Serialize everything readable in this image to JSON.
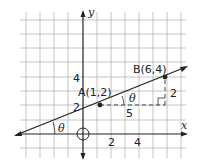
{
  "diagram": {
    "axes": {
      "x_label": "x",
      "y_label": "y"
    },
    "x_ticks": [
      "2",
      "4"
    ],
    "y_ticks": [
      "2",
      "4"
    ],
    "points": [
      {
        "name": "A",
        "label": "A(1,2)",
        "x": 1,
        "y": 2
      },
      {
        "name": "B",
        "label": "B(6,4)",
        "x": 6,
        "y": 4
      }
    ],
    "run_label": "5",
    "rise_label": "2",
    "angle_label": "θ",
    "origin_marker": "circle"
  }
}
